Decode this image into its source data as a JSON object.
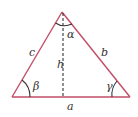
{
  "diagram": {
    "type": "triangle",
    "colors": {
      "sides": "#c24d66",
      "altitude": "#333333",
      "arcs": "#333333",
      "labels": "#333333"
    },
    "vertices": {
      "apex": [
        62,
        12
      ],
      "left": [
        12,
        97
      ],
      "right": [
        130,
        97
      ]
    },
    "labels": {
      "side_a": "a",
      "side_b": "b",
      "side_c": "c",
      "height": "h",
      "angle_alpha": "α",
      "angle_beta": "β",
      "angle_gamma": "γ"
    }
  }
}
